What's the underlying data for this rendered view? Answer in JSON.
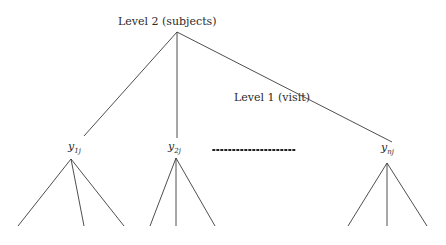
{
  "diagram": {
    "level2_label": "Level 2 (subjects)",
    "level1_label": "Level 1 (visit)",
    "root": {
      "x": 177,
      "y": 32
    },
    "nodes": [
      {
        "id": "y1j",
        "base": "y",
        "subscript": "1j",
        "label_x": 68,
        "label_y": 150,
        "branch_end": {
          "x": 84,
          "y": 136
        },
        "vertex": {
          "x": 71,
          "y": 159
        },
        "leaves": [
          {
            "x": 18,
            "y": 226
          },
          {
            "x": 84,
            "y": 226
          },
          {
            "x": 124,
            "y": 226
          }
        ]
      },
      {
        "id": "y2j",
        "base": "y",
        "subscript": "2j",
        "label_x": 168,
        "label_y": 150,
        "branch_end": {
          "x": 177,
          "y": 138
        },
        "vertex": {
          "x": 176,
          "y": 158
        },
        "leaves": [
          {
            "x": 150,
            "y": 226
          },
          {
            "x": 176,
            "y": 226
          },
          {
            "x": 215,
            "y": 226
          }
        ]
      },
      {
        "id": "ynj",
        "base": "y",
        "subscript": "nj",
        "label_x": 381,
        "label_y": 151,
        "branch_end": {
          "x": 392,
          "y": 142
        },
        "vertex": {
          "x": 387,
          "y": 163
        },
        "leaves": [
          {
            "x": 348,
            "y": 226
          },
          {
            "x": 387,
            "y": 226
          },
          {
            "x": 427,
            "y": 226
          }
        ]
      }
    ],
    "ellipsis": {
      "x1": 213,
      "x2": 295,
      "y": 150,
      "glyph": "…"
    },
    "colors": {
      "background": "#ffffff",
      "line": "#3a3a3a",
      "text": "#2a2a2a"
    }
  }
}
